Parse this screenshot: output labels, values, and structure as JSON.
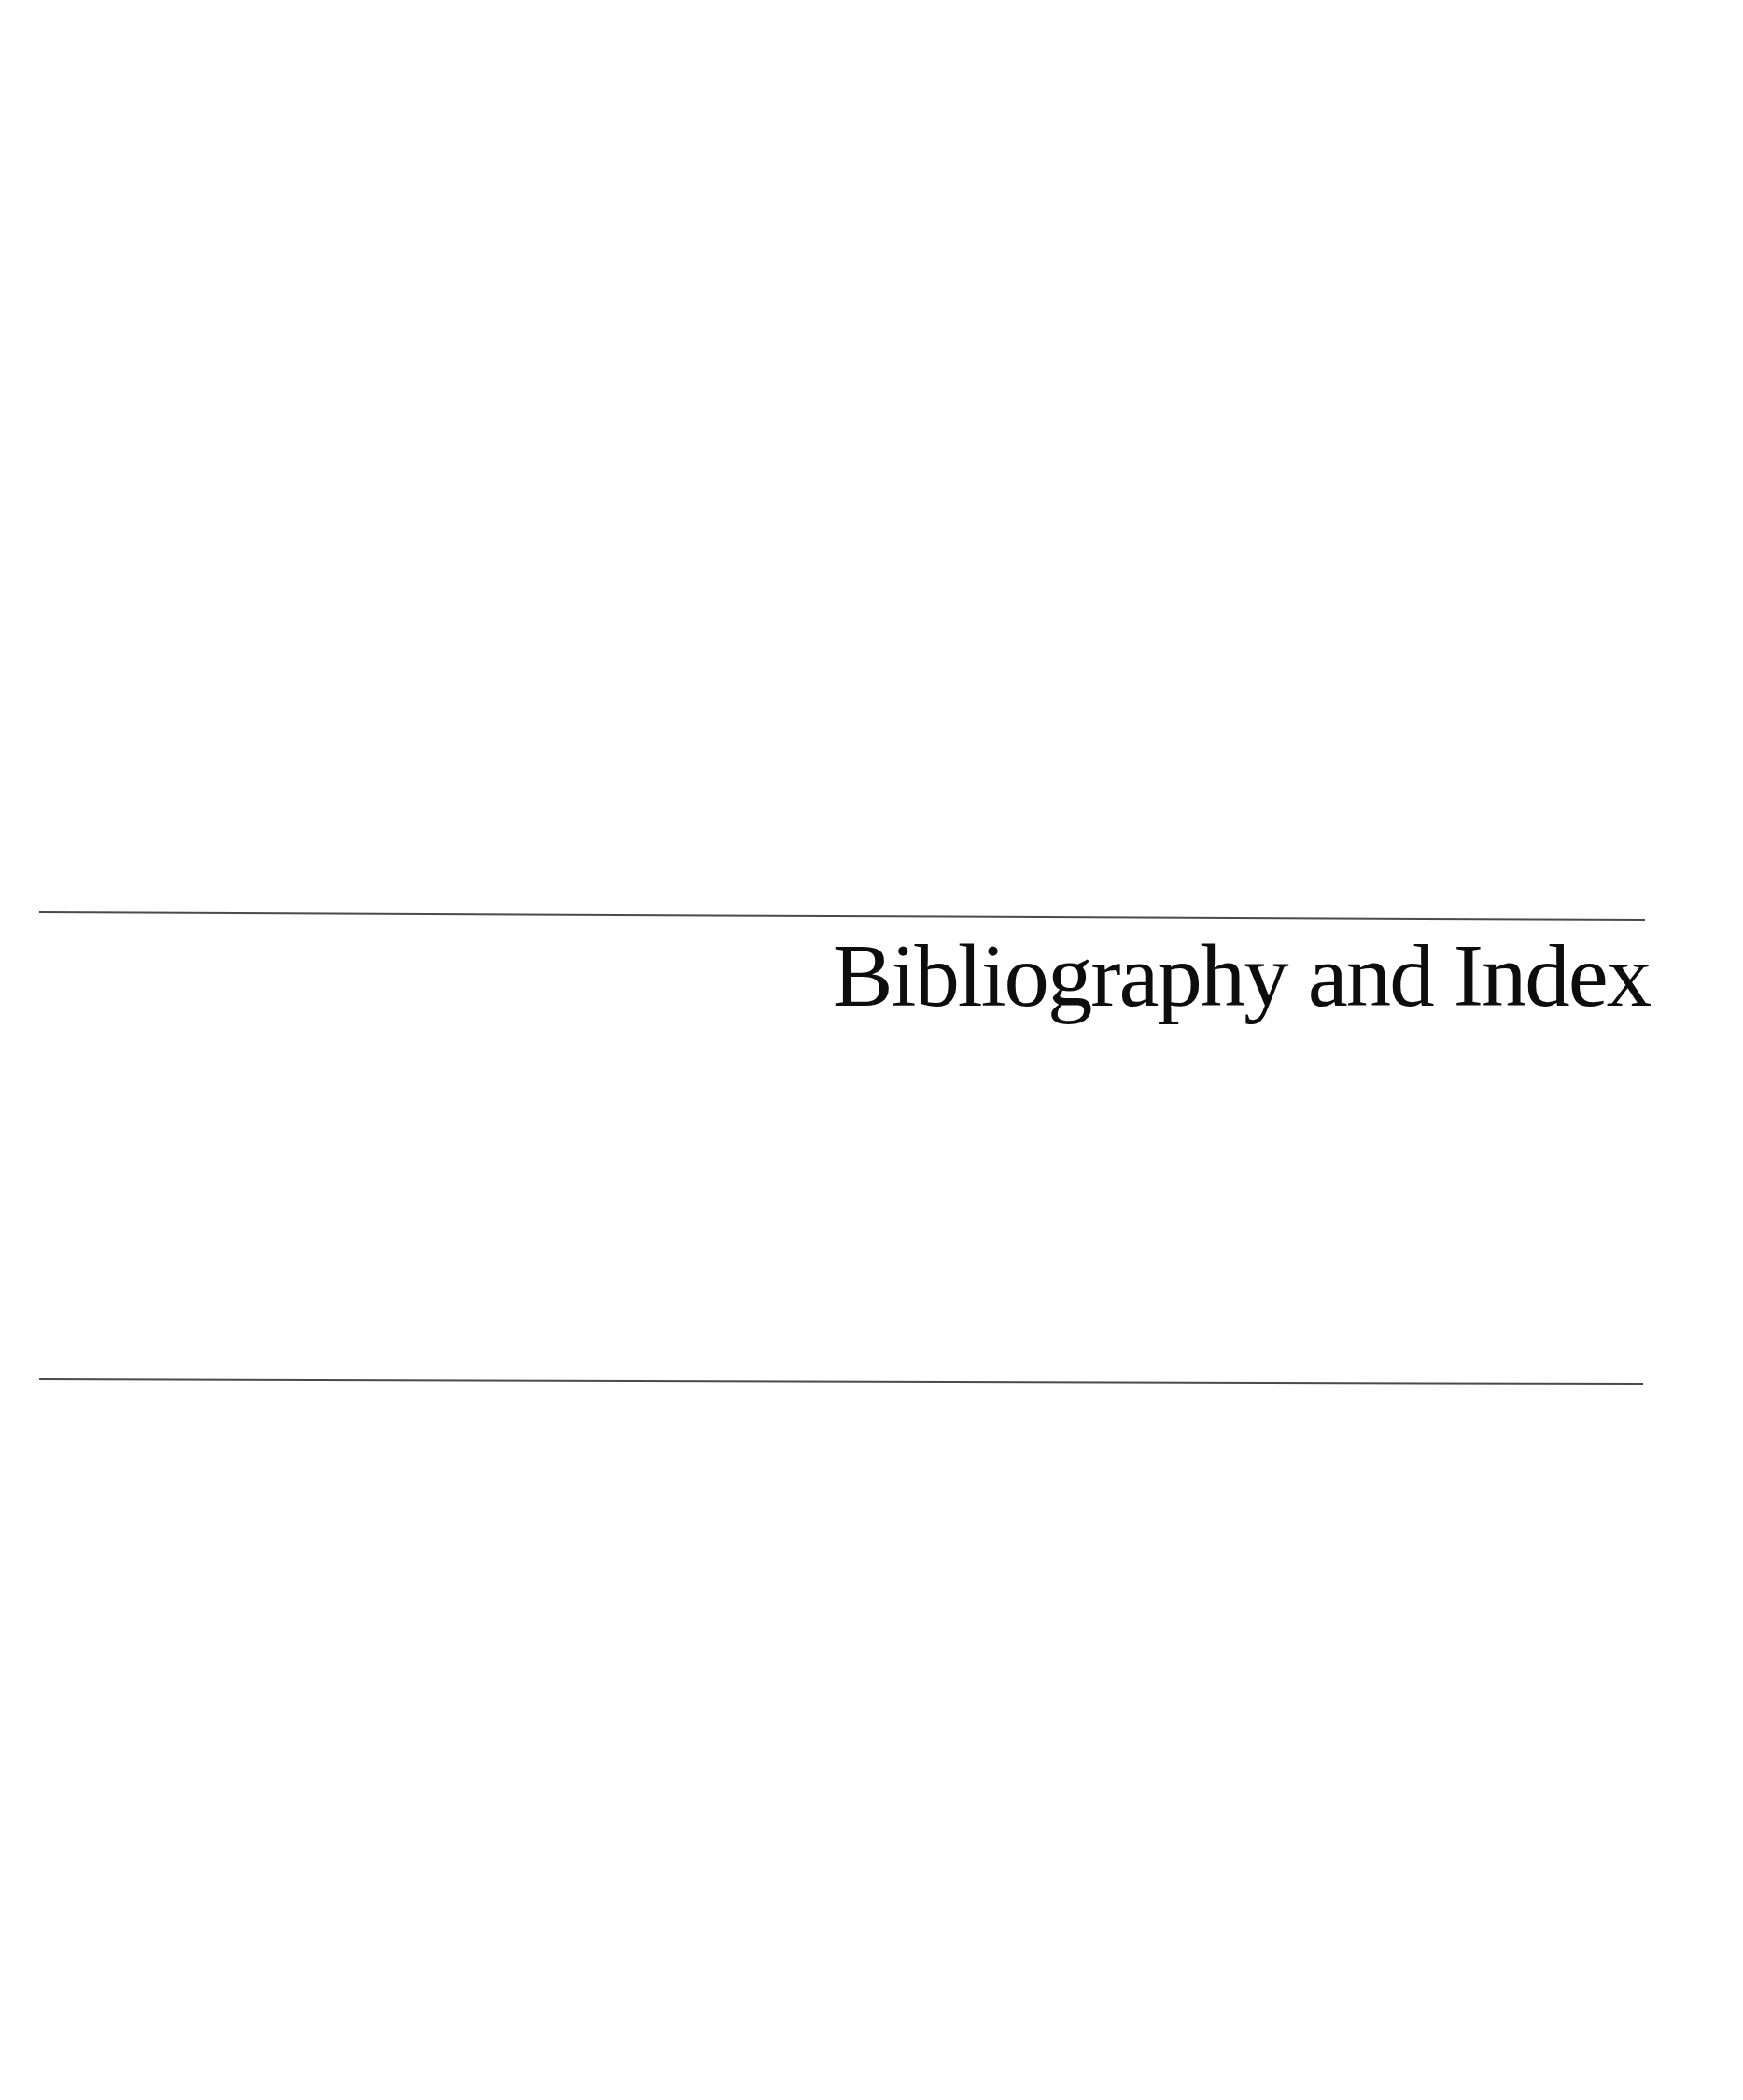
{
  "page": {
    "title": "Bibliography and Index",
    "background_color": "#fefefe",
    "rule_color": "#4a4a4a",
    "text_color": "#0d0d0d"
  }
}
